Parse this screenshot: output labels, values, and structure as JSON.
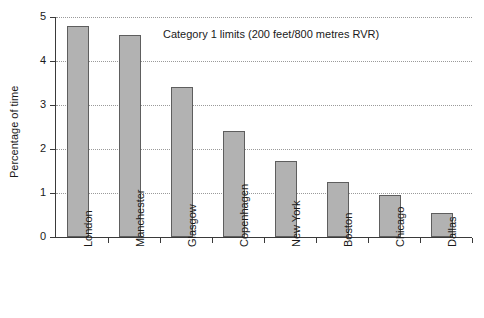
{
  "chart_data": {
    "type": "bar",
    "title": "Category 1 limits (200 feet/800 metres RVR)",
    "xlabel": "",
    "ylabel": "Percentage of time",
    "categories": [
      "London",
      "Manchester",
      "Glasgow",
      "Copenhagen",
      "New York",
      "Boston",
      "Chicago",
      "Dallas"
    ],
    "values": [
      4.8,
      4.6,
      3.41,
      2.41,
      1.72,
      1.24,
      0.95,
      0.55
    ],
    "ylim": [
      0,
      5
    ],
    "yticks": [
      0,
      1,
      2,
      3,
      4,
      5
    ],
    "ytick_labels": [
      "0",
      "1",
      "2",
      "3",
      "4",
      "5"
    ],
    "grid": true,
    "legend": "none",
    "bar_color": "#b2b2b2",
    "bar_edge_color": "#5e5e5e",
    "grid_color": "#9a9a9a",
    "axis_color": "#3a3a3a",
    "background": "#ffffff"
  }
}
